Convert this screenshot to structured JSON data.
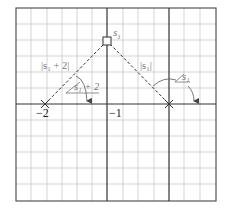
{
  "diagram": {
    "type": "s-plane root locus geometry",
    "grid": {
      "columns": 13,
      "rows": 12,
      "color": "#c8c8c8",
      "axis_color": "#333333",
      "border_color": "#555555"
    },
    "axes": {
      "real_axis_label_left": "−2",
      "real_axis_label_mid": "−1"
    },
    "points": {
      "test_point": {
        "label": "s",
        "subscript": "1",
        "marker": "square"
      },
      "pole_left": {
        "marker": "x",
        "value": "-2"
      },
      "pole_right": {
        "marker": "x",
        "value": "0"
      }
    },
    "vectors": {
      "left": {
        "magnitude_label": "|s₁ + 2|",
        "angle_label_prefix": "∠",
        "angle_label": "s₁ + 2"
      },
      "right": {
        "magnitude_label": "|s₁|",
        "angle_label_prefix": "∠",
        "angle_label": "s₁"
      }
    }
  }
}
